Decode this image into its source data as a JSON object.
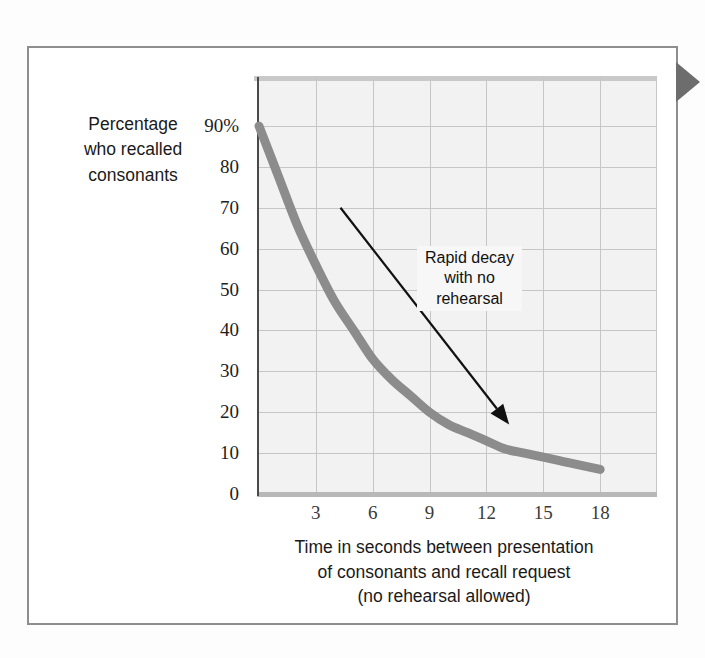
{
  "figure": {
    "edge_marker_icon": "right-triangle-tab-icon",
    "frame_color": "#8e8e8e"
  },
  "chart_data": {
    "type": "line",
    "title": "",
    "subtitle": "",
    "xlabel": "Time in seconds between presentation of consonants and recall request (no rehearsal allowed)",
    "xlabel_lines": [
      "Time in seconds between presentation",
      "of consonants and recall request",
      "(no rehearsal allowed)"
    ],
    "ylabel": "Percentage who recalled consonants",
    "ylabel_lines": [
      "Percentage",
      "who recalled",
      "consonants"
    ],
    "x": [
      0,
      1,
      2,
      3,
      4,
      5,
      6,
      7,
      8,
      9,
      10,
      11,
      12,
      13,
      14,
      15,
      16,
      17,
      18
    ],
    "values": [
      90,
      78,
      66,
      56,
      47,
      40,
      33,
      28,
      24,
      20,
      17,
      15,
      13,
      11,
      10,
      9,
      8,
      7,
      6
    ],
    "series": [
      {
        "name": "Percentage who recalled consonants",
        "color": "#8c8c8c",
        "values": [
          90,
          78,
          66,
          56,
          47,
          40,
          33,
          28,
          24,
          20,
          17,
          15,
          13,
          11,
          10,
          9,
          8,
          7,
          6
        ]
      }
    ],
    "xlim": [
      0,
      21
    ],
    "ylim": [
      0,
      90
    ],
    "x_ticks": [
      3,
      6,
      9,
      12,
      15,
      18
    ],
    "x_tick_labels": [
      "3",
      "6",
      "9",
      "12",
      "15",
      "18"
    ],
    "y_ticks": [
      0,
      10,
      20,
      30,
      40,
      50,
      60,
      70,
      80,
      90
    ],
    "y_tick_labels": [
      "0",
      "10",
      "20",
      "30",
      "40",
      "50",
      "60",
      "70",
      "80",
      "90%"
    ],
    "grid": true,
    "legend": "none",
    "plot_background": "#f2f2f2",
    "gridline_color": "#c6c6c6",
    "line_color": "#8c8c8c",
    "annotations": [
      {
        "text": "Rapid decay with no rehearsal",
        "lines": [
          "Rapid decay",
          "with no",
          "rehearsal"
        ],
        "arrow_from_x": 4.3,
        "arrow_from_y": 70,
        "arrow_to_x": 13.2,
        "arrow_to_y": 17,
        "arrow_color": "#111111"
      }
    ]
  }
}
